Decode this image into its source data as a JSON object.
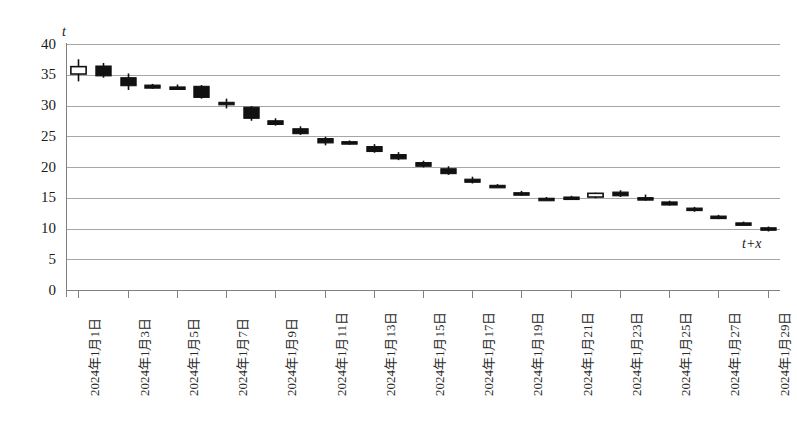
{
  "chart_data": {
    "type": "candlestick",
    "title": "",
    "subtitle": "",
    "xlabel": "t+x",
    "ylabel": "t",
    "ylim": [
      0,
      40
    ],
    "y_ticks": [
      0,
      5,
      10,
      15,
      20,
      25,
      30,
      35,
      40
    ],
    "grid": "horizontal",
    "legend": "none",
    "x_tick_labels": [
      "2024年1月1日",
      "2024年1月3日",
      "2024年1月5日",
      "2024年1月7日",
      "2024年1月9日",
      "2024年1月11日",
      "2024年1月13日",
      "2024年1月15日",
      "2024年1月17日",
      "2024年1月19日",
      "2024年1月21日",
      "2024年1月23日",
      "2024年1月25日",
      "2024年1月27日",
      "2024年1月29日"
    ],
    "x_tick_every": 2,
    "series_name": "",
    "candles": [
      {
        "date": "2024年1月1日",
        "open": 35.2,
        "high": 37.6,
        "low": 34.0,
        "close": 36.4,
        "dir": "up"
      },
      {
        "date": "2024年1月2日",
        "open": 36.5,
        "high": 37.0,
        "low": 34.6,
        "close": 34.9,
        "dir": "down"
      },
      {
        "date": "2024年1月3日",
        "open": 34.6,
        "high": 35.3,
        "low": 32.6,
        "close": 33.3,
        "dir": "down"
      },
      {
        "date": "2024年1月4日",
        "open": 33.4,
        "high": 33.6,
        "low": 32.8,
        "close": 32.9,
        "dir": "down"
      },
      {
        "date": "2024年1月5日",
        "open": 33.1,
        "high": 33.5,
        "low": 32.7,
        "close": 32.8,
        "dir": "down"
      },
      {
        "date": "2024年1月6日",
        "open": 33.2,
        "high": 33.4,
        "low": 31.2,
        "close": 31.4,
        "dir": "down"
      },
      {
        "date": "2024年1月7日",
        "open": 30.6,
        "high": 31.2,
        "low": 29.6,
        "close": 30.3,
        "dir": "down"
      },
      {
        "date": "2024年1月8日",
        "open": 29.8,
        "high": 30.0,
        "low": 27.6,
        "close": 28.0,
        "dir": "down"
      },
      {
        "date": "2024年1月9日",
        "open": 27.6,
        "high": 28.0,
        "low": 26.8,
        "close": 27.0,
        "dir": "down"
      },
      {
        "date": "2024年1月10日",
        "open": 26.3,
        "high": 26.7,
        "low": 25.3,
        "close": 25.5,
        "dir": "down"
      },
      {
        "date": "2024年1月11日",
        "open": 24.7,
        "high": 25.0,
        "low": 23.6,
        "close": 24.0,
        "dir": "down"
      },
      {
        "date": "2024年1月12日",
        "open": 24.2,
        "high": 24.4,
        "low": 23.7,
        "close": 23.8,
        "dir": "down"
      },
      {
        "date": "2024年1月13日",
        "open": 23.4,
        "high": 23.8,
        "low": 22.4,
        "close": 22.6,
        "dir": "down"
      },
      {
        "date": "2024年1月14日",
        "open": 22.1,
        "high": 22.5,
        "low": 21.2,
        "close": 21.4,
        "dir": "down"
      },
      {
        "date": "2024年1月15日",
        "open": 20.8,
        "high": 21.1,
        "low": 20.0,
        "close": 20.2,
        "dir": "down"
      },
      {
        "date": "2024年1月16日",
        "open": 19.8,
        "high": 20.2,
        "low": 18.8,
        "close": 19.0,
        "dir": "down"
      },
      {
        "date": "2024年1月17日",
        "open": 18.1,
        "high": 18.5,
        "low": 17.4,
        "close": 17.6,
        "dir": "down"
      },
      {
        "date": "2024年1月18日",
        "open": 17.1,
        "high": 17.3,
        "low": 16.8,
        "close": 16.9,
        "dir": "down"
      },
      {
        "date": "2024年1月19日",
        "open": 15.9,
        "high": 16.2,
        "low": 15.4,
        "close": 15.6,
        "dir": "down"
      },
      {
        "date": "2024年1月20日",
        "open": 15.0,
        "high": 15.2,
        "low": 14.6,
        "close": 14.8,
        "dir": "down"
      },
      {
        "date": "2024年1月21日",
        "open": 15.2,
        "high": 15.4,
        "low": 14.9,
        "close": 15.0,
        "dir": "down"
      },
      {
        "date": "2024年1月22日",
        "open": 15.2,
        "high": 15.9,
        "low": 15.0,
        "close": 15.8,
        "dir": "up"
      },
      {
        "date": "2024年1月23日",
        "open": 16.0,
        "high": 16.3,
        "low": 15.2,
        "close": 15.4,
        "dir": "down"
      },
      {
        "date": "2024年1月24日",
        "open": 15.1,
        "high": 15.6,
        "low": 14.6,
        "close": 14.8,
        "dir": "down"
      },
      {
        "date": "2024年1月25日",
        "open": 14.4,
        "high": 14.6,
        "low": 13.8,
        "close": 13.9,
        "dir": "down"
      },
      {
        "date": "2024年1月26日",
        "open": 13.4,
        "high": 13.6,
        "low": 12.8,
        "close": 13.0,
        "dir": "down"
      },
      {
        "date": "2024年1月27日",
        "open": 12.1,
        "high": 12.3,
        "low": 11.6,
        "close": 11.8,
        "dir": "down"
      },
      {
        "date": "2024年1月28日",
        "open": 11.0,
        "high": 11.2,
        "low": 10.7,
        "close": 10.8,
        "dir": "down"
      },
      {
        "date": "2024年1月29日",
        "open": 10.2,
        "high": 10.4,
        "low": 9.6,
        "close": 9.8,
        "dir": "down"
      }
    ],
    "colors": {
      "up_fill": "#ffffff",
      "down_fill": "#111111",
      "outline": "#111111",
      "gridline": "#a6a6a6",
      "axis": "#808080",
      "tick_text": "#1a1a1a"
    }
  },
  "caption": {
    "text": ""
  }
}
